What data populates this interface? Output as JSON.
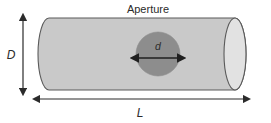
{
  "figure": {
    "type": "technical-diagram",
    "title": "Aperture",
    "background_color": "#ffffff"
  },
  "labels": {
    "title": "Aperture",
    "height_label": "D",
    "length_label": "L",
    "aperture_label": "d"
  },
  "colors": {
    "tube_body": "#c9c9c9",
    "tube_end_face": "#e2e2e2",
    "aperture_fill": "#8d8d8d",
    "outline": "#5a5a5a",
    "arrow": "#2b2b2b",
    "text": "#2b2b2b"
  },
  "geometry": {
    "tube_left_x": 38,
    "tube_right_x": 246,
    "tube_top_y": 18,
    "tube_bottom_y": 90,
    "end_ellipse_rx": 11,
    "end_ellipse_ry": 36,
    "aperture_center_x": 158,
    "aperture_center_y": 54,
    "aperture_radius": 22
  },
  "annotations": [
    {
      "name": "height-dimension",
      "label": "D",
      "orientation": "vertical",
      "arrow": "double-headed"
    },
    {
      "name": "length-dimension",
      "label": "L",
      "orientation": "horizontal",
      "arrow": "double-headed"
    },
    {
      "name": "aperture-dimension",
      "label": "d",
      "orientation": "horizontal",
      "arrow": "double-headed"
    }
  ]
}
